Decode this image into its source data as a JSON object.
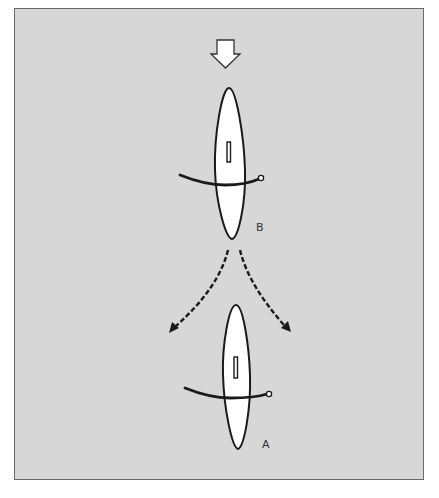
{
  "diagram": {
    "type": "needle-lens-rotation",
    "colors": {
      "background": "#d7d7d7",
      "frame": "#6a6a6a",
      "stroke": "#1a1a1a",
      "fill": "#ffffff"
    },
    "elements": {
      "force_arrow": {
        "direction": "down",
        "icon": "hollow-down-arrow"
      },
      "figure_b": {
        "label": "B"
      },
      "figure_a": {
        "label": "A"
      },
      "transition_arrows": {
        "style": "dashed",
        "count": 2,
        "directions": [
          "down-left",
          "down-right"
        ]
      }
    }
  }
}
